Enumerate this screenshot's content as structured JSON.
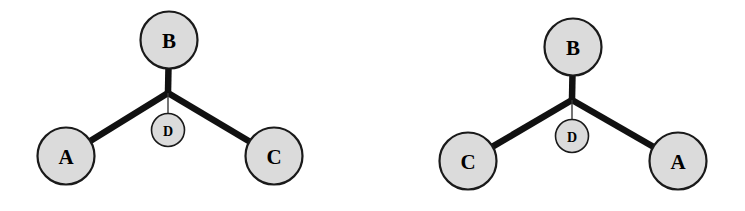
{
  "figure": {
    "background_color": "#ffffff",
    "node_fill_color": "#dbdbdb",
    "node_stroke_color": "#1a1a1a",
    "edge_color": "#111111",
    "thin_edge_color": "#3a3a3a"
  },
  "diagrams": [
    {
      "id": "left",
      "junction": {
        "x": 168,
        "y": 93
      },
      "nodes": [
        {
          "id": "b",
          "label": "B",
          "cx": 169,
          "cy": 40,
          "r": 28.5,
          "size": "major"
        },
        {
          "id": "a",
          "label": "A",
          "cx": 66,
          "cy": 156,
          "r": 28.5,
          "size": "major"
        },
        {
          "id": "c",
          "label": "C",
          "cx": 274,
          "cy": 156,
          "r": 28.5,
          "size": "major"
        },
        {
          "id": "d",
          "label": "D",
          "cx": 168,
          "cy": 130,
          "r": 16.5,
          "size": "minor"
        }
      ],
      "edges": [
        {
          "from": "junction",
          "to": "b",
          "weight": "thick"
        },
        {
          "from": "junction",
          "to": "a",
          "weight": "thick"
        },
        {
          "from": "junction",
          "to": "c",
          "weight": "thick"
        },
        {
          "from": "junction",
          "to": "d",
          "weight": "thin"
        }
      ]
    },
    {
      "id": "right",
      "junction": {
        "x": 199,
        "y": 100
      },
      "nodes": [
        {
          "id": "b",
          "label": "B",
          "cx": 200,
          "cy": 47,
          "r": 28.5,
          "size": "major"
        },
        {
          "id": "c",
          "label": "C",
          "cx": 95,
          "cy": 161,
          "r": 28.5,
          "size": "major"
        },
        {
          "id": "a",
          "label": "A",
          "cx": 305,
          "cy": 161,
          "r": 28.5,
          "size": "major"
        },
        {
          "id": "d",
          "label": "D",
          "cx": 199,
          "cy": 136,
          "r": 16.5,
          "size": "minor"
        }
      ],
      "edges": [
        {
          "from": "junction",
          "to": "b",
          "weight": "thick"
        },
        {
          "from": "junction",
          "to": "c",
          "weight": "thick"
        },
        {
          "from": "junction",
          "to": "a",
          "weight": "thick"
        },
        {
          "from": "junction",
          "to": "d",
          "weight": "thin"
        }
      ]
    }
  ]
}
